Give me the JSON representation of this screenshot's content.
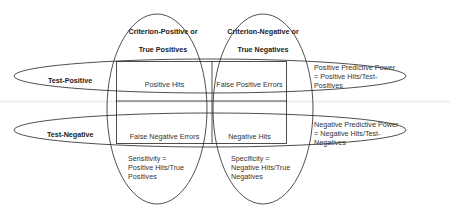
{
  "columns": {
    "criterion_positive": {
      "line1": "Criterion-Positive or",
      "line2": "True Positives"
    },
    "criterion_negative": {
      "line1": "Criterion-Negative or",
      "line2": "True Negatives"
    }
  },
  "rows": {
    "test_positive": "Test-Positive",
    "test_negative": "Test-Negative"
  },
  "cells": {
    "positive_hits": "Positive Hits",
    "false_positive_errors": "False Positive Errors",
    "false_negative_errors": "False Negative Errors",
    "negative_hits": "Negative Hits"
  },
  "formulas": {
    "ppp": {
      "line1": "Positive Predictive Power",
      "line2": "= Positive Hits/Test-",
      "line3": "Positives"
    },
    "npp": {
      "line1": "Negative Predictive Power",
      "line2": "= Negative Hits/Test-",
      "line3": "Negatives"
    },
    "sensitivity": {
      "line1": "Sensitivity =",
      "line2": "Positive Hits/True",
      "line3": "Positives"
    },
    "specificity": {
      "line1": "Specificity =",
      "line2": "Negative Hits/True",
      "line3": "Negatives"
    }
  },
  "colors": {
    "stroke": "#222222",
    "text": "#333333"
  }
}
